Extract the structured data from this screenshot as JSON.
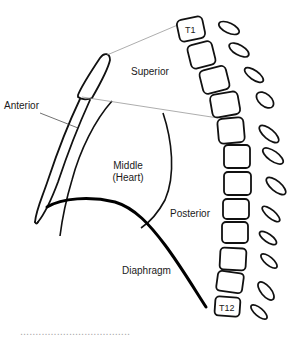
{
  "diagram": {
    "labels": {
      "superior": "Superior",
      "anterior": "Anterior",
      "middle_line1": "Middle",
      "middle_line2": "(Heart)",
      "posterior": "Posterior",
      "diaphragm": "Diaphragm"
    },
    "vertebrae": {
      "top": "T1",
      "bottom": "T12",
      "count": 12
    },
    "colors": {
      "stroke": "#111111",
      "thin_line": "#8a8a8a",
      "background": "#ffffff"
    }
  },
  "caption": {
    "partial_text": "...................................."
  }
}
